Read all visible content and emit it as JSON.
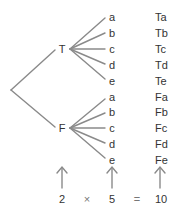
{
  "diagram": {
    "title": "",
    "line_color": "#8a8a8a",
    "text_color": "#333333",
    "first_level": [
      {
        "label": "T",
        "branches": [
          "a",
          "b",
          "c",
          "d",
          "e"
        ],
        "outcomes": [
          "Ta",
          "Tb",
          "Tc",
          "Td",
          "Te"
        ]
      },
      {
        "label": "F",
        "branches": [
          "a",
          "b",
          "c",
          "d",
          "e"
        ],
        "outcomes": [
          "Fa",
          "Fb",
          "Fc",
          "Fd",
          "Fe"
        ]
      }
    ],
    "equation": {
      "left": "2",
      "times": "×",
      "middle": "5",
      "equals": "=",
      "right": "10"
    }
  }
}
